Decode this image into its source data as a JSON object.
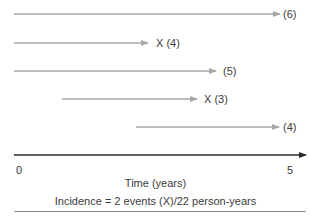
{
  "diagram": {
    "type": "person-time follow-up diagram",
    "colors": {
      "follow_up_line": "#a8a8a8",
      "axis": "#2a2a2a",
      "text": "#3c3c3c",
      "divider": "#8a8a8a"
    },
    "subjects": [
      {
        "id": 1,
        "start_year": 0.0,
        "end_year": 5.0,
        "event": false,
        "label": "(6)"
      },
      {
        "id": 2,
        "start_year": 0.0,
        "end_year": 2.5,
        "event": true,
        "label": "X (4)"
      },
      {
        "id": 3,
        "start_year": 0.0,
        "end_year": 3.8,
        "event": false,
        "label": "(5)"
      },
      {
        "id": 4,
        "start_year": 0.9,
        "end_year": 3.4,
        "event": true,
        "label": "X (3)"
      },
      {
        "id": 5,
        "start_year": 2.2,
        "end_year": 5.0,
        "event": false,
        "label": "(4)"
      }
    ],
    "axis": {
      "tick_start": "0",
      "tick_end": "5",
      "title": "Time (years)"
    },
    "incidence_text": "Incidence = 2 events (X)/22 person-years"
  }
}
